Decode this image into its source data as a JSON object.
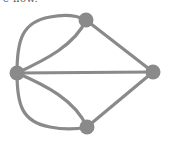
{
  "caption": {
    "text": "e now."
  },
  "graph": {
    "name": "Königsberg bridges multigraph",
    "colors": {
      "edge": "#8a8a8a",
      "node": "#8a8a8a"
    },
    "nodes": [
      {
        "id": "left",
        "x": 17,
        "y": 73,
        "r": 7
      },
      {
        "id": "top",
        "x": 86,
        "y": 20,
        "r": 7
      },
      {
        "id": "right",
        "x": 153,
        "y": 72,
        "r": 7
      },
      {
        "id": "bottom",
        "x": 87,
        "y": 127,
        "r": 7
      }
    ],
    "edges": [
      {
        "from": "left",
        "to": "top",
        "type": "outer-arc"
      },
      {
        "from": "left",
        "to": "top",
        "type": "inner-arc"
      },
      {
        "from": "left",
        "to": "bottom",
        "type": "outer-arc"
      },
      {
        "from": "left",
        "to": "bottom",
        "type": "inner-arc"
      },
      {
        "from": "left",
        "to": "right",
        "type": "straight"
      },
      {
        "from": "top",
        "to": "right",
        "type": "straight"
      },
      {
        "from": "bottom",
        "to": "right",
        "type": "straight"
      }
    ]
  }
}
